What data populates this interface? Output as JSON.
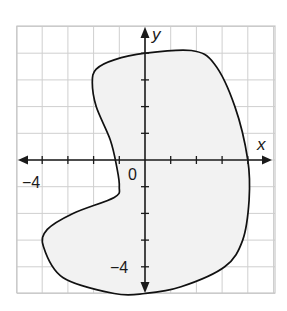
{
  "figure": {
    "type": "coordinate-plane-region",
    "grid": {
      "x_range": [
        -5,
        5
      ],
      "y_range": [
        -5,
        5
      ],
      "step": 1,
      "origin_px": [
        145,
        160
      ],
      "unit_px": [
        25.7,
        26.7
      ],
      "left_px": 17,
      "right_px": 275,
      "top_px": 26,
      "bottom_px": 293
    },
    "axes": {
      "x_label": "x",
      "y_label": "y",
      "origin_label": "0",
      "x_tick_label": "−4",
      "y_tick_label": "−4"
    },
    "region": {
      "description": "Closed kidney/bean-shaped curve with shaded interior",
      "fill": "#f2f2f2",
      "stroke": "#111111",
      "points_units": [
        [
          0,
          4.0
        ],
        [
          1.8,
          4.1
        ],
        [
          2.7,
          3.6
        ],
        [
          3.5,
          2.0
        ],
        [
          4.0,
          0
        ],
        [
          4.05,
          -1.5
        ],
        [
          3.8,
          -3.0
        ],
        [
          3.1,
          -4.0
        ],
        [
          1.4,
          -4.75
        ],
        [
          0,
          -5.0
        ],
        [
          -1.2,
          -5.0
        ],
        [
          -3.2,
          -4.4
        ],
        [
          -3.95,
          -3.25
        ],
        [
          -3.8,
          -2.6
        ],
        [
          -2.8,
          -2.0
        ],
        [
          -1.2,
          -1.4
        ],
        [
          -1.0,
          -1.0
        ],
        [
          -1.1,
          -0.25
        ],
        [
          -1.35,
          0.75
        ],
        [
          -1.9,
          2.0
        ],
        [
          -2.05,
          2.9
        ],
        [
          -1.9,
          3.4
        ],
        [
          -1.2,
          3.75
        ]
      ]
    },
    "colors": {
      "grid": "#cfcfcf",
      "axis": "#1a1a1a",
      "region_fill": "#f2f2f2"
    }
  }
}
